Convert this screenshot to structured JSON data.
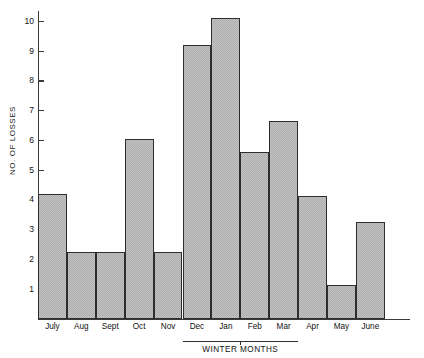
{
  "chart_data": {
    "type": "bar",
    "title": "",
    "xlabel": "",
    "ylabel": "NO. OF LOSSES",
    "categories": [
      "July",
      "Aug",
      "Sept",
      "Oct",
      "Nov",
      "Dec",
      "Jan",
      "Feb",
      "Mar",
      "Apr",
      "May",
      "June"
    ],
    "values": [
      4.2,
      2.25,
      2.25,
      6.05,
      2.25,
      9.2,
      10.1,
      5.6,
      6.65,
      4.15,
      1.15,
      3.25
    ],
    "ylim": [
      0,
      10.35
    ],
    "yticks": [
      1,
      2,
      3,
      4,
      5,
      6,
      7,
      8,
      9,
      10
    ],
    "ytick_labels": [
      "1",
      "2",
      "3",
      "4",
      "5",
      "6",
      "7",
      "8",
      "9",
      "10"
    ],
    "ytick_marks_visible": [
      5,
      6,
      7,
      8,
      9,
      10
    ],
    "grid": false,
    "legend": false,
    "bar_fill_color": "#bdbdbd",
    "bar_edge_color": "#2e2e2e",
    "axis_color": "#3a3a3a",
    "annotations": [
      {
        "name": "winter-months",
        "label": "WINTER MONTHS",
        "spans_categories": [
          "Dec",
          "Jan",
          "Feb",
          "Mar"
        ]
      }
    ]
  }
}
